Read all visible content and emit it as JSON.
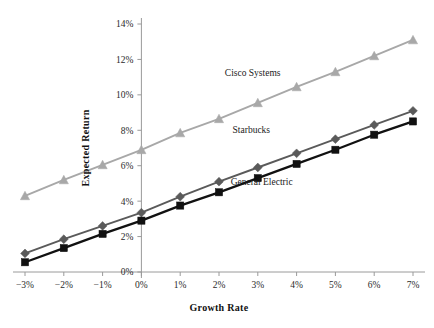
{
  "chart_data": {
    "type": "line",
    "title": "",
    "subtitle": "",
    "xlabel": "Growth Rate",
    "ylabel": "Expected Return",
    "x": [
      -3,
      -2,
      -1,
      0,
      1,
      2,
      3,
      4,
      5,
      6,
      7
    ],
    "xtick_labels": [
      "−3%",
      "−2%",
      "−1%",
      "0%",
      "1%",
      "2%",
      "3%",
      "4%",
      "5%",
      "6%",
      "7%"
    ],
    "ytick_labels": [
      "0%",
      "2%",
      "4%",
      "6%",
      "8%",
      "10%",
      "12%",
      "14%"
    ],
    "yticks": [
      0,
      2,
      4,
      6,
      8,
      10,
      12,
      14
    ],
    "xlim": [
      -3,
      7
    ],
    "ylim": [
      0,
      14
    ],
    "grid": false,
    "legend_position": "inline-annotation",
    "series": [
      {
        "name": "Cisco Systems",
        "color": "#a8a8a8",
        "marker": "triangle",
        "values": [
          4.3,
          5.2,
          6.05,
          6.9,
          7.85,
          8.65,
          9.55,
          10.45,
          11.3,
          12.2,
          13.1
        ],
        "annotation": "Cisco Systems",
        "annotation_x": 2.15,
        "annotation_y": 11.05
      },
      {
        "name": "Starbucks",
        "color": "#5a5a5a",
        "marker": "diamond",
        "values": [
          1.05,
          1.85,
          2.6,
          3.35,
          4.25,
          5.1,
          5.9,
          6.7,
          7.5,
          8.3,
          9.1
        ],
        "annotation": "Starbucks",
        "annotation_x": 2.35,
        "annotation_y": 7.85
      },
      {
        "name": "General Electric",
        "color": "#111111",
        "marker": "square",
        "values": [
          0.55,
          1.35,
          2.15,
          2.9,
          3.75,
          4.5,
          5.3,
          6.1,
          6.9,
          7.75,
          8.5
        ],
        "annotation": "General Electric",
        "annotation_x": 2.3,
        "annotation_y": 4.9
      }
    ]
  },
  "axes": {
    "y_axis_title": "Expected Return",
    "x_axis_title": "Growth Rate"
  }
}
